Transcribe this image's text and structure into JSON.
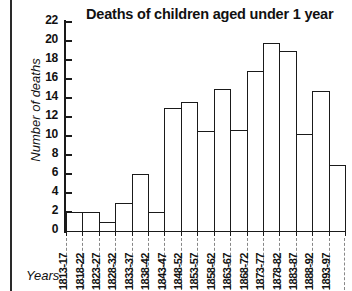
{
  "chart_data": {
    "type": "bar",
    "title": "Deaths of children aged under 1 year",
    "xlabel": "Years",
    "ylabel": "Number of deaths",
    "ylim": [
      0,
      22
    ],
    "ytick_step": 2,
    "yticks": [
      0,
      2,
      4,
      6,
      8,
      10,
      12,
      14,
      16,
      18,
      20,
      22
    ],
    "grid": false,
    "legend": null,
    "bar_style": {
      "fill": "#ffffff",
      "edge": "#1a1a1a",
      "gap": 0
    },
    "categories": [
      "1813-17",
      "1818-22",
      "1823-27",
      "1828-32",
      "1833-37",
      "1838-42",
      "1843-47",
      "1848-52",
      "1853-57",
      "1858-62",
      "1863-67",
      "1868-72",
      "1873-77",
      "1878-82",
      "1883-87",
      "1888-92",
      "1893-97"
    ],
    "values": [
      2,
      2,
      1,
      3,
      6,
      2,
      13,
      13.6,
      10.5,
      15,
      10.6,
      16.8,
      19.8,
      19,
      10.2,
      14.7,
      7
    ]
  }
}
